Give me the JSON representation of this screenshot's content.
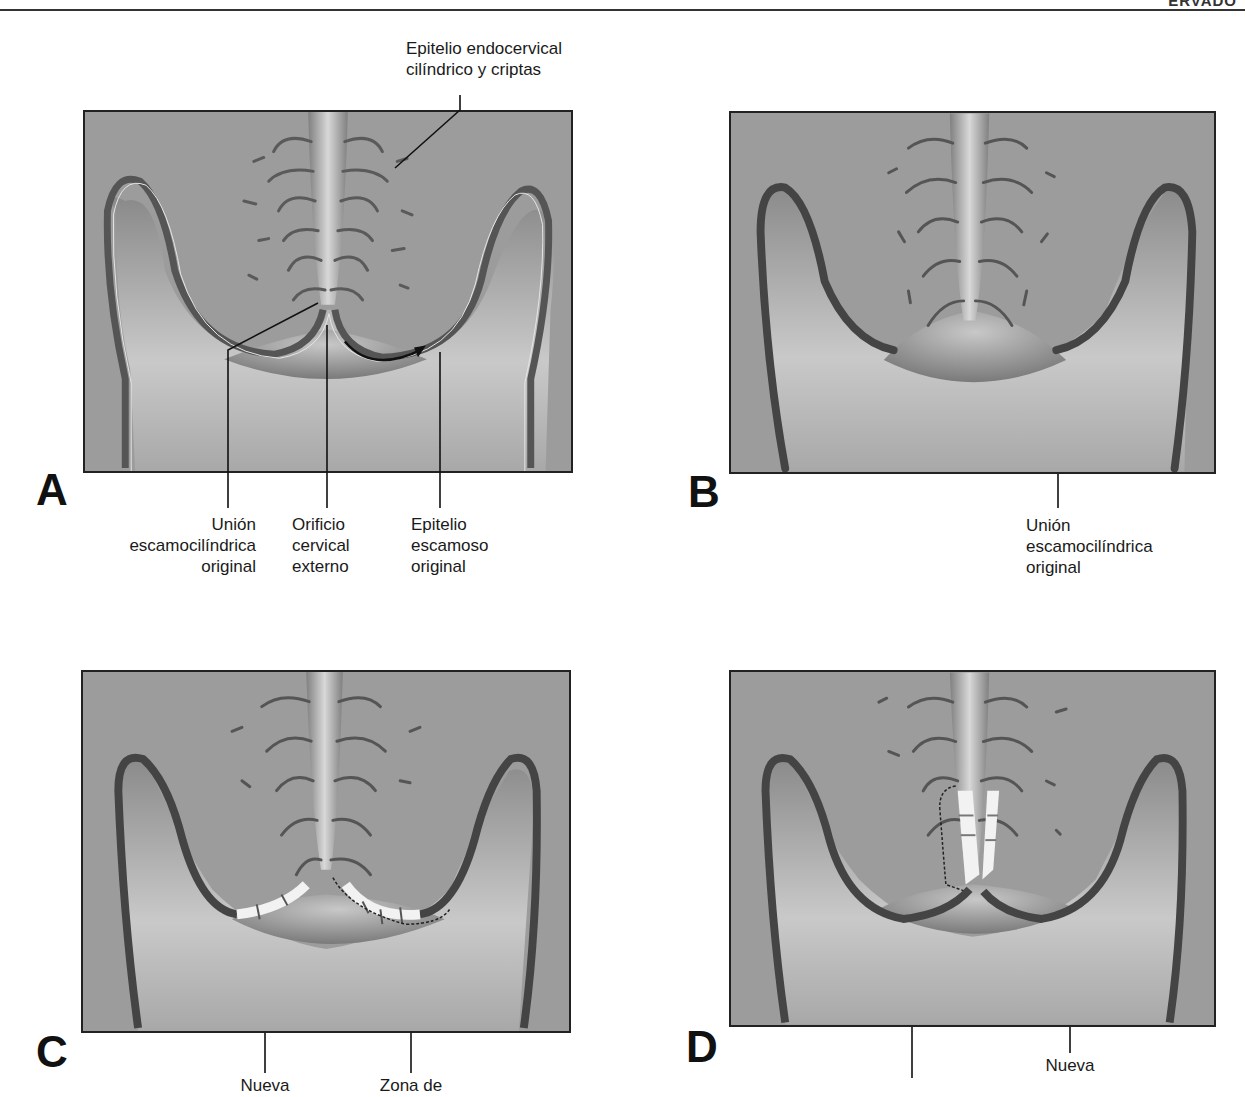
{
  "header": {
    "cut_text": "ERVADO"
  },
  "panels": [
    {
      "letter": "A"
    },
    {
      "letter": "B"
    },
    {
      "letter": "C"
    },
    {
      "letter": "D"
    }
  ],
  "labels": {
    "a_top": {
      "line1": "Epitelio endocervical",
      "line2": "cilíndrico y criptas"
    },
    "a_union": {
      "line1": "Unión",
      "line2": "escamocilíndrica",
      "line3": "original"
    },
    "a_orificio": {
      "line1": "Orificio",
      "line2": "cervical",
      "line3": "externo"
    },
    "a_epitelio": {
      "line1": "Epitelio",
      "line2": "escamoso",
      "line3": "original"
    },
    "b_union": {
      "line1": "Unión",
      "line2": "escamocilíndrica",
      "line3": "original"
    },
    "c_nueva": {
      "line1": "Nueva"
    },
    "c_zona": {
      "line1": "Zona de"
    },
    "d_nueva": {
      "line1": "Nueva"
    }
  },
  "colors": {
    "background": "#9c9c9c",
    "epithelium_dark": "#4a4a4a",
    "new_epithelium": "#f2f2f2",
    "frame": "#222222"
  }
}
